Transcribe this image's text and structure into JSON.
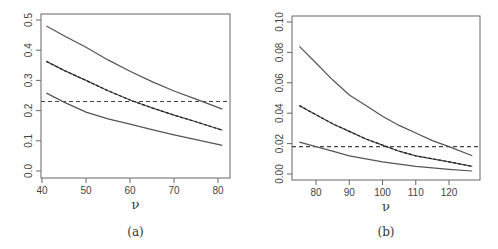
{
  "chart_data": [
    {
      "type": "line",
      "panel": "a",
      "caption": "(a)",
      "title": "",
      "xlabel": "ν",
      "ylabel": "",
      "xlim": [
        40,
        82
      ],
      "ylim": [
        0,
        0.5
      ],
      "xticks": [
        40,
        50,
        60,
        70,
        80
      ],
      "yticks": [
        0.0,
        0.1,
        0.2,
        0.3,
        0.4,
        0.5
      ],
      "ytick_labels": [
        "0.0",
        "0.1",
        "0.2",
        "0.3",
        "0.4",
        "0.5"
      ],
      "grid": false,
      "legend": null,
      "x": [
        41,
        45,
        50,
        55,
        60,
        65,
        70,
        75,
        81
      ],
      "series": [
        {
          "name": "upper",
          "style": "solid",
          "values": [
            0.48,
            0.448,
            0.41,
            0.368,
            0.33,
            0.296,
            0.265,
            0.238,
            0.205
          ]
        },
        {
          "name": "middle",
          "style": "solid+dashed overlay",
          "values": [
            0.363,
            0.333,
            0.3,
            0.266,
            0.235,
            0.209,
            0.185,
            0.163,
            0.135
          ]
        },
        {
          "name": "lower",
          "style": "solid",
          "values": [
            0.258,
            0.228,
            0.195,
            0.173,
            0.155,
            0.137,
            0.12,
            0.104,
            0.085
          ]
        }
      ],
      "hline": {
        "y": 0.23,
        "style": "dashed"
      }
    },
    {
      "type": "line",
      "panel": "b",
      "caption": "(b)",
      "title": "",
      "xlabel": "ν",
      "ylabel": "",
      "xlim": [
        74,
        129
      ],
      "ylim": [
        0,
        0.1
      ],
      "xticks": [
        80,
        90,
        100,
        110,
        120
      ],
      "yticks": [
        0.0,
        0.02,
        0.04,
        0.06,
        0.08,
        0.1
      ],
      "ytick_labels": [
        "0.00",
        "0.02",
        "0.04",
        "0.06",
        "0.08",
        "0.10"
      ],
      "grid": false,
      "legend": null,
      "x": [
        75,
        80,
        85,
        90,
        95,
        100,
        105,
        110,
        115,
        120,
        127
      ],
      "series": [
        {
          "name": "upper",
          "style": "solid",
          "values": [
            0.084,
            0.073,
            0.062,
            0.052,
            0.045,
            0.038,
            0.032,
            0.027,
            0.022,
            0.018,
            0.012
          ]
        },
        {
          "name": "middle",
          "style": "solid+dashed overlay",
          "values": [
            0.045,
            0.039,
            0.033,
            0.028,
            0.023,
            0.019,
            0.015,
            0.012,
            0.01,
            0.008,
            0.005
          ]
        },
        {
          "name": "lower",
          "style": "solid",
          "values": [
            0.021,
            0.018,
            0.015,
            0.012,
            0.01,
            0.008,
            0.0065,
            0.005,
            0.004,
            0.003,
            0.002
          ]
        }
      ],
      "hline": {
        "y": 0.018,
        "style": "dashed"
      }
    }
  ],
  "colors": {
    "line": "#555555",
    "dashed": "#444444",
    "axis": "#666666"
  }
}
